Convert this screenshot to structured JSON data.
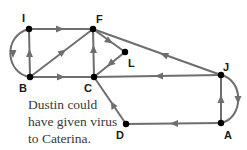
{
  "diagram": {
    "type": "directed-graph",
    "colors": {
      "edge": "#6e6e6e",
      "node": "#000000",
      "label": "#1a1a1a",
      "caption": "#3a3a3a"
    },
    "nodes": [
      {
        "id": "I",
        "label": "I",
        "x": 29,
        "y": 29
      },
      {
        "id": "F",
        "label": "F",
        "x": 93,
        "y": 29
      },
      {
        "id": "L",
        "label": "L",
        "x": 125,
        "y": 52
      },
      {
        "id": "B",
        "label": "B",
        "x": 30,
        "y": 77
      },
      {
        "id": "C",
        "label": "C",
        "x": 94,
        "y": 77
      },
      {
        "id": "J",
        "label": "J",
        "x": 221,
        "y": 75
      },
      {
        "id": "D",
        "label": "D",
        "x": 126,
        "y": 124
      },
      {
        "id": "A",
        "label": "A",
        "x": 221,
        "y": 123
      }
    ],
    "edges": [
      {
        "from": "I",
        "to": "F",
        "shape": "straight"
      },
      {
        "from": "B",
        "to": "I",
        "shape": "straight"
      },
      {
        "from": "I",
        "to": "B",
        "shape": "curved-left"
      },
      {
        "from": "B",
        "to": "F",
        "shape": "straight"
      },
      {
        "from": "B",
        "to": "C",
        "shape": "straight"
      },
      {
        "from": "C",
        "to": "F",
        "shape": "straight"
      },
      {
        "from": "F",
        "to": "L",
        "shape": "straight"
      },
      {
        "from": "L",
        "to": "C",
        "shape": "straight"
      },
      {
        "from": "J",
        "to": "F",
        "shape": "straight"
      },
      {
        "from": "J",
        "to": "C",
        "shape": "straight"
      },
      {
        "from": "A",
        "to": "J",
        "shape": "straight"
      },
      {
        "from": "J",
        "to": "A",
        "shape": "curved-right"
      },
      {
        "from": "A",
        "to": "D",
        "shape": "straight"
      },
      {
        "from": "D",
        "to": "C",
        "shape": "straight"
      }
    ],
    "caption": {
      "lines": [
        "Dustin could",
        "have given virus",
        "to Caterina."
      ]
    }
  }
}
